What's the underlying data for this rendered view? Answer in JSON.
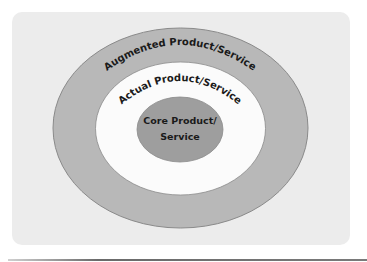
{
  "diagram": {
    "type": "concentric-ellipses",
    "colors": {
      "panel_background": "#ececec",
      "outer_ring": "#b8b8b8",
      "middle_ring": "#fbfbfb",
      "core": "#9e9e9e",
      "stroke": "#8a8a8a",
      "text": "#1a1a1a"
    },
    "layers": {
      "outer": {
        "label": "Augmented Product/Service"
      },
      "middle": {
        "label": "Actual Product/Service"
      },
      "core": {
        "label_line1": "Core Product/",
        "label_line2": "Service"
      }
    }
  }
}
